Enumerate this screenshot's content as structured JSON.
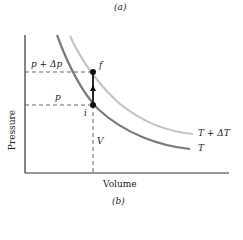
{
  "top_caption": "(a)",
  "bottom_caption": "(b)",
  "axes": {
    "xlabel": "Volume",
    "ylabel": "Pressure"
  },
  "labels": {
    "p_plus_dp": "p + Δp",
    "p": "p",
    "point_f": "f",
    "point_i": "i",
    "volume_mark": "V",
    "curve_high": "T + ΔT",
    "curve_low": "T"
  },
  "colors": {
    "curve_T": "#7a7a7a",
    "curve_T_plus_dT": "#c4c4c4",
    "axis": "#333333",
    "points": "#111111"
  }
}
